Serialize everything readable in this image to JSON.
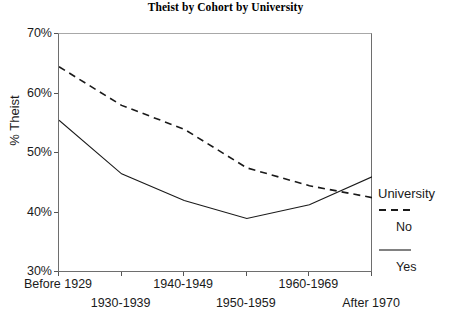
{
  "chart_data": {
    "type": "line",
    "title": "Theist by Cohort by University",
    "xlabel": "",
    "ylabel": "% Theist",
    "categories": [
      "Before 1929",
      "1930-1939",
      "1940-1949",
      "1950-1959",
      "1960-1969",
      "After 1970"
    ],
    "ylim": [
      30,
      70
    ],
    "ytick_labels": [
      "30%",
      "40%",
      "50%",
      "60%",
      "70%"
    ],
    "ytick_values": [
      30,
      40,
      50,
      60,
      70
    ],
    "grid": false,
    "legend_position": "right",
    "legend_title": "University",
    "series": [
      {
        "name": "No",
        "style": "dashed",
        "values": [
          64.5,
          58.0,
          54.0,
          47.5,
          44.5,
          42.5
        ]
      },
      {
        "name": "Yes",
        "style": "solid",
        "values": [
          55.5,
          46.5,
          42.0,
          39.0,
          41.3,
          46.0
        ]
      }
    ]
  },
  "axis": {
    "y_labels": [
      "70%",
      "60%",
      "50%",
      "40%",
      "30%"
    ],
    "x_labels": [
      "Before 1929",
      "1930-1939",
      "1940-1949",
      "1950-1959",
      "1960-1969",
      "After 1970"
    ]
  },
  "legend": {
    "title": "University",
    "items": [
      {
        "label": "No"
      },
      {
        "label": "Yes"
      }
    ]
  },
  "colors": {
    "line": "#1a1a1a",
    "axis": "#6e6e6e",
    "background": "#ffffff"
  }
}
